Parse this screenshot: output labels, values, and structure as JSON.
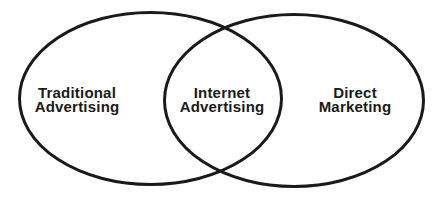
{
  "diagram": {
    "type": "venn",
    "sets": [
      {
        "id": "left",
        "label_lines": [
          "Traditional",
          "Advertising"
        ]
      },
      {
        "id": "right",
        "label_lines": [
          "Direct",
          "Marketing"
        ]
      }
    ],
    "intersection": {
      "label_lines": [
        "Internet",
        "Advertising"
      ]
    },
    "colors": {
      "stroke": "#1a1a1a",
      "text": "#1a1a1a",
      "background": "#ffffff"
    }
  }
}
